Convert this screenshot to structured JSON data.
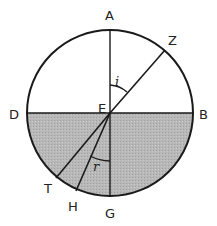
{
  "diagram": {
    "title": "",
    "colors": {
      "stroke": "#1a1a1a",
      "water": "#b4b4b4",
      "background": "#ffffff"
    },
    "circle": {
      "cx": 110,
      "cy": 113,
      "r": 83
    },
    "points": {
      "A": "A",
      "Z": "Z",
      "D": "D",
      "E": "E",
      "B": "B",
      "T": "T",
      "H": "H",
      "G": "G"
    },
    "angles": {
      "incidence": "i",
      "refraction": "r"
    }
  }
}
